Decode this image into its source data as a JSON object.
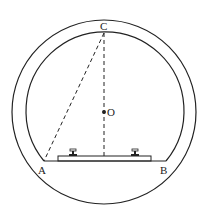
{
  "diagram": {
    "labels": {
      "A": "A",
      "B": "B",
      "C": "C",
      "O": "O"
    },
    "colors": {
      "stroke": "#222222",
      "background": "#ffffff"
    }
  }
}
